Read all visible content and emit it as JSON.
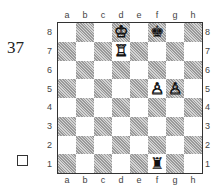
{
  "diagram": {
    "number": "37",
    "to_move_indicator": "white-square",
    "files": [
      "a",
      "b",
      "c",
      "d",
      "e",
      "f",
      "g",
      "h"
    ],
    "ranks": [
      "8",
      "7",
      "6",
      "5",
      "4",
      "3",
      "2",
      "1"
    ],
    "pieces": [
      {
        "square": "d8",
        "piece": "king",
        "color": "white",
        "glyph": "♔"
      },
      {
        "square": "f8",
        "piece": "king",
        "color": "black",
        "glyph": "♚"
      },
      {
        "square": "d7",
        "piece": "rook",
        "color": "white",
        "glyph": "♖"
      },
      {
        "square": "f5",
        "piece": "pawn",
        "color": "white",
        "glyph": "♙"
      },
      {
        "square": "g5",
        "piece": "pawn",
        "color": "white",
        "glyph": "♙"
      },
      {
        "square": "f1",
        "piece": "rook",
        "color": "black",
        "glyph": "♜"
      }
    ]
  }
}
